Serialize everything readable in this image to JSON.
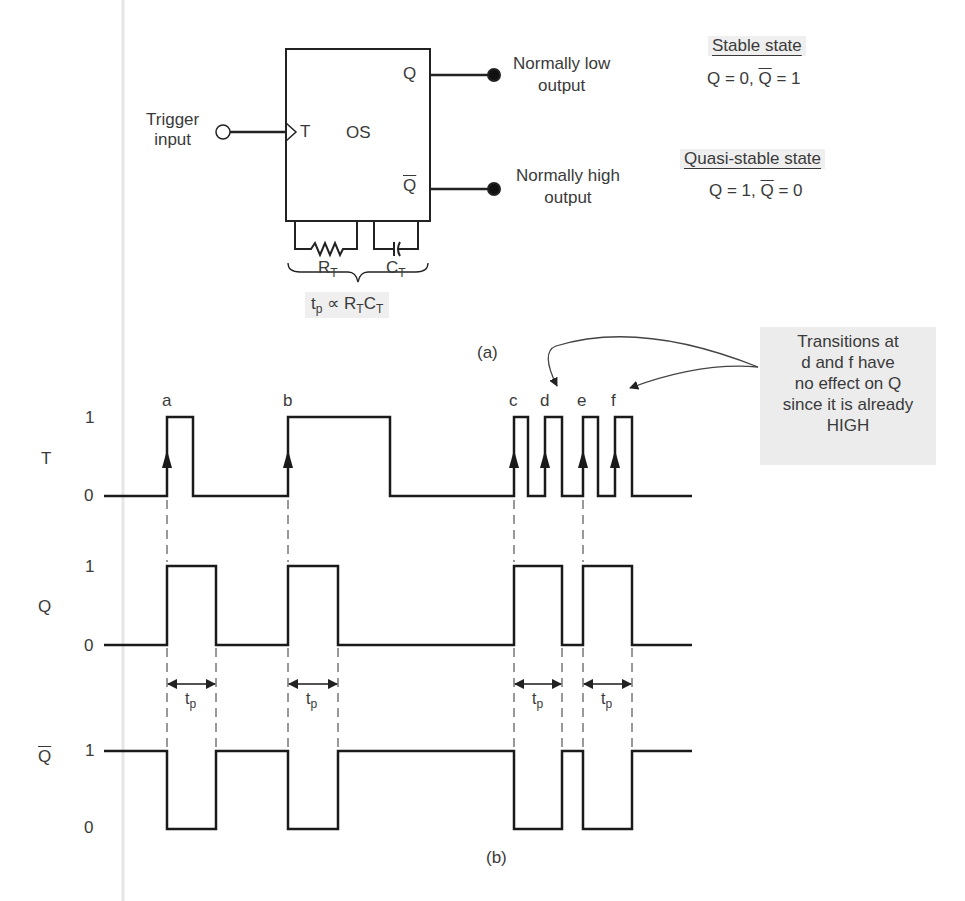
{
  "figure": {
    "block": {
      "name": "OS",
      "trigger_pin": "T",
      "q_pin": "Q",
      "qbar_pin": "Q̄",
      "trigger_label": [
        "Trigger",
        "input"
      ],
      "q_output_label": [
        "Normally low",
        "output"
      ],
      "qbar_output_label": [
        "Normally high",
        "output"
      ],
      "resistor": "R",
      "resistor_sub": "T",
      "capacitor": "C",
      "capacitor_sub": "T",
      "formula_t": "t",
      "formula_p": "p",
      "formula_rest": " ∝ R",
      "formula_t2": "T",
      "formula_c": "C",
      "formula_t3": "T",
      "caption": "(a)"
    },
    "states": {
      "stable_title": "Stable state",
      "stable_q": "Q = 0, ",
      "stable_qbar": "Q",
      "stable_qbar_val": " = 1",
      "quasi_title": "Quasi-stable state",
      "quasi_q": "Q = 1, ",
      "quasi_qbar": "Q",
      "quasi_qbar_val": " = 0"
    },
    "note": {
      "lines": [
        "Transitions at",
        "d and f have",
        "no effect on Q",
        "since it is already",
        "HIGH"
      ]
    },
    "timing": {
      "caption": "(b)",
      "signals": [
        {
          "name": "T",
          "overbar": false,
          "high_label": "1",
          "low_label": "0"
        },
        {
          "name": "Q",
          "overbar": false,
          "high_label": "1",
          "low_label": "0"
        },
        {
          "name": "Q",
          "overbar": true,
          "high_label": "1",
          "low_label": "0"
        }
      ],
      "trigger_labels": [
        "a",
        "b",
        "c",
        "d",
        "e",
        "f"
      ],
      "pulse_width_label": "t",
      "pulse_width_sub": "p"
    }
  },
  "chart_data": {
    "type": "line",
    "xlabel": "time",
    "ylabel": "logic level",
    "series": [
      {
        "name": "T",
        "edges_x": [
          167,
          193,
          288,
          390,
          514,
          528,
          545,
          562,
          583,
          598,
          615,
          632
        ],
        "initial": 0,
        "labels": [
          "a",
          "b",
          "c",
          "d",
          "e",
          "f"
        ]
      },
      {
        "name": "Q",
        "edges_x": [
          167,
          216,
          288,
          338,
          514,
          562,
          583,
          632
        ],
        "initial": 0
      },
      {
        "name": "Q̄",
        "edges_x": [
          167,
          216,
          288,
          338,
          514,
          562,
          583,
          632
        ],
        "initial": 1
      }
    ],
    "x_range": [
      104,
      692
    ],
    "levels": [
      0,
      1
    ],
    "annotations": [
      "tp",
      "tp",
      "tp",
      "tp",
      "Transitions at d and f have no effect on Q since it is already HIGH"
    ]
  }
}
